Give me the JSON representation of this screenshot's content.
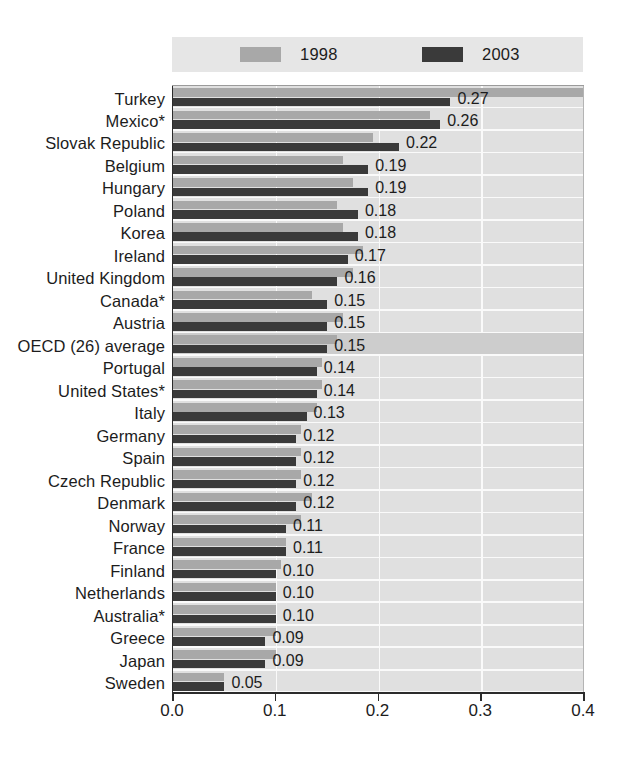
{
  "legend": {
    "items": [
      {
        "label": "1998",
        "color": "#a8a8a8",
        "swatch_name": "legend-swatch-1998"
      },
      {
        "label": "2003",
        "color": "#3a3a3a",
        "swatch_name": "legend-swatch-2003"
      }
    ]
  },
  "axis": {
    "ticks": [
      "0.0",
      "0.1",
      "0.2",
      "0.3",
      "0.4"
    ],
    "min": 0.0,
    "max": 0.4
  },
  "chart_data": {
    "type": "bar",
    "orientation": "horizontal",
    "title": "",
    "subtitle": "",
    "xlabel": "",
    "ylabel": "",
    "xlim": [
      0.0,
      0.4
    ],
    "xticks": [
      0.0,
      0.1,
      0.2,
      0.3,
      0.4
    ],
    "grid": "vertical-white-gridlines",
    "legend_position": "top",
    "value_labels_series": "2003",
    "highlight_category": "OECD (26) average",
    "categories": [
      "Turkey",
      "Mexico*",
      "Slovak Republic",
      "Belgium",
      "Hungary",
      "Poland",
      "Korea",
      "Ireland",
      "United Kingdom",
      "Canada*",
      "Austria",
      "OECD (26) average",
      "Portugal",
      "United States*",
      "Italy",
      "Germany",
      "Spain",
      "Czech Republic",
      "Denmark",
      "Norway",
      "France",
      "Finland",
      "Netherlands",
      "Australia*",
      "Greece",
      "Japan",
      "Sweden"
    ],
    "series": [
      {
        "name": "1998",
        "color": "#a8a8a8",
        "values": [
          0.4,
          0.25,
          0.195,
          0.165,
          0.175,
          0.16,
          0.165,
          0.185,
          0.175,
          0.135,
          0.165,
          0.16,
          0.145,
          0.145,
          0.14,
          0.125,
          0.125,
          0.125,
          0.135,
          0.125,
          0.11,
          0.105,
          0.1,
          0.1,
          0.1,
          0.1,
          0.05
        ]
      },
      {
        "name": "2003",
        "color": "#3a3a3a",
        "values": [
          0.27,
          0.26,
          0.22,
          0.19,
          0.19,
          0.18,
          0.18,
          0.17,
          0.16,
          0.15,
          0.15,
          0.15,
          0.14,
          0.14,
          0.13,
          0.12,
          0.12,
          0.12,
          0.12,
          0.11,
          0.11,
          0.1,
          0.1,
          0.1,
          0.09,
          0.09,
          0.05
        ]
      }
    ],
    "value_labels": [
      "0.27",
      "0.26",
      "0.22",
      "0.19",
      "0.19",
      "0.18",
      "0.18",
      "0.17",
      "0.16",
      "0.15",
      "0.15",
      "0.15",
      "0.14",
      "0.14",
      "0.13",
      "0.12",
      "0.12",
      "0.12",
      "0.12",
      "0.11",
      "0.11",
      "0.10",
      "0.10",
      "0.10",
      "0.09",
      "0.09",
      "0.05"
    ]
  }
}
